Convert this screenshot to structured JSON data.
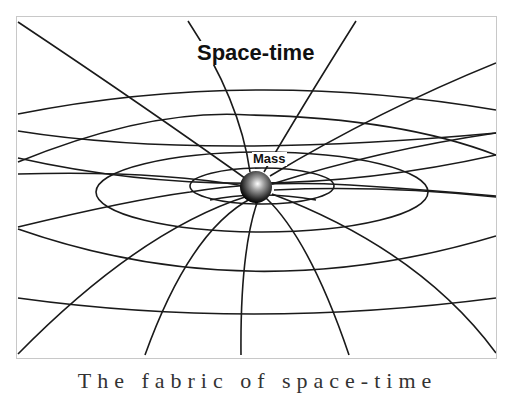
{
  "diagram": {
    "title": "Space-time",
    "mass_label": "Mass",
    "caption_partial": "The fabric of space-time",
    "colors": {
      "line": "#1a1a1a",
      "frame": "#c8c8c8",
      "sphere_highlight": "#ffffff",
      "sphere_shadow": "#000000"
    },
    "elements": {
      "grid_rings": 7,
      "radial_lines": 12,
      "sphere": "gray shaded sphere at grid center"
    }
  }
}
